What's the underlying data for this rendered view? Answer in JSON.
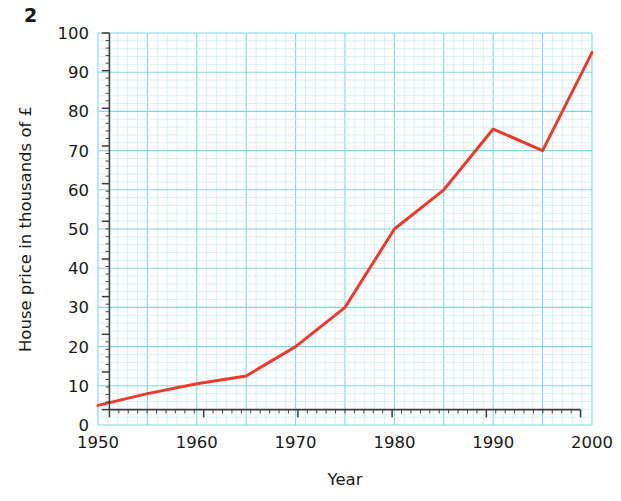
{
  "question_number": "2",
  "chart_data": {
    "type": "line",
    "title": "",
    "xlabel": "Year",
    "ylabel": "House price in thousands of £",
    "xlim": [
      1950,
      2000
    ],
    "ylim": [
      0,
      100
    ],
    "x_ticks": [
      1950,
      1960,
      1970,
      1980,
      1990,
      2000
    ],
    "x_tick_labels": [
      "1950",
      "1960",
      "1970",
      "1980",
      "1990",
      "2000"
    ],
    "y_ticks": [
      0,
      10,
      20,
      30,
      40,
      50,
      60,
      70,
      80,
      90,
      100
    ],
    "y_tick_labels": [
      "0",
      "10",
      "20",
      "30",
      "40",
      "50",
      "60",
      "70",
      "80",
      "90",
      "100"
    ],
    "x_minor_step": 1,
    "y_minor_step": 2,
    "x_major_grid_step": 5,
    "y_major_grid_step": 10,
    "grid": true,
    "grid_color_major": "#7fd8e0",
    "grid_color_minor": "#cdeef2",
    "legend": false,
    "series": [
      {
        "name": "House price",
        "color": "#ea3b2d",
        "line_width": 3,
        "x": [
          1950,
          1955,
          1960,
          1965,
          1970,
          1975,
          1980,
          1985,
          1990,
          1995,
          2000
        ],
        "values": [
          5,
          8,
          10.5,
          12.5,
          20,
          30,
          50,
          60,
          75.5,
          70,
          95
        ]
      }
    ]
  },
  "axis_colors": {
    "axis_line": "#3d3d3d",
    "text": "#1a1a1a"
  }
}
